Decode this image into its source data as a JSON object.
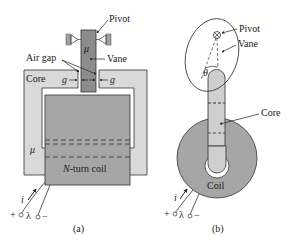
{
  "figure": {
    "panels": [
      {
        "id": "a",
        "caption": "(a)",
        "labels": {
          "pivot": "Pivot",
          "vane": "Vane",
          "air_gap": "Air gap",
          "core": "Core",
          "gap_left": "g",
          "gap_right": "g",
          "vane_mu": "μ",
          "core_mu": "μ",
          "coil": "N-turn coil",
          "coil_N": "N",
          "coil_rest": "-turn coil",
          "current": "i",
          "flux_linkage": "λ",
          "plus": "+",
          "minus": "−"
        }
      },
      {
        "id": "b",
        "caption": "(b)",
        "labels": {
          "pivot": "Pivot",
          "vane": "Vane",
          "angle": "θ",
          "core": "Core",
          "coil": "Coil",
          "current": "i",
          "flux_linkage": "λ",
          "plus": "+",
          "minus": "−"
        }
      }
    ],
    "colors": {
      "core_fill": "#d9d9d9",
      "coil_fill": "#a6a6a6",
      "vane_fill": "#8c8c8c",
      "arm_fill": "#cfcfcf",
      "stroke": "#333333",
      "background": "#ffffff"
    }
  }
}
